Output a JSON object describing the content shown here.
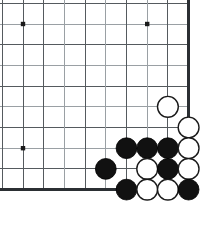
{
  "diagram": {
    "type": "go-board-corner",
    "board": {
      "columns": 10,
      "rows": 10,
      "cell_size": 20.7,
      "origin_x": 2.3,
      "origin_y": 3.3,
      "line_color": "#555a5e",
      "faint_line_color": "#9aa0a4",
      "edge_color": "#2b2f33",
      "background_color": "#ffffff",
      "right_edge_index": 9,
      "bottom_edge_index": 9,
      "top_open": true,
      "left_open": true
    },
    "star_points": [
      {
        "col": 1,
        "row": 1
      },
      {
        "col": 7,
        "row": 1
      },
      {
        "col": 1,
        "row": 7
      }
    ],
    "stone_radius": 10.4,
    "stones": [
      {
        "color": "white",
        "col": 8,
        "row": 5
      },
      {
        "color": "white",
        "col": 9,
        "row": 6
      },
      {
        "color": "black",
        "col": 6,
        "row": 7
      },
      {
        "color": "black",
        "col": 7,
        "row": 7
      },
      {
        "color": "black",
        "col": 8,
        "row": 7
      },
      {
        "color": "white",
        "col": 9,
        "row": 7
      },
      {
        "color": "black",
        "col": 5,
        "row": 8
      },
      {
        "color": "white",
        "col": 7,
        "row": 8
      },
      {
        "color": "black",
        "col": 8,
        "row": 8
      },
      {
        "color": "white",
        "col": 9,
        "row": 8
      },
      {
        "color": "black",
        "col": 6,
        "row": 9
      },
      {
        "color": "white",
        "col": 7,
        "row": 9
      },
      {
        "color": "white",
        "col": 8,
        "row": 9
      },
      {
        "color": "black",
        "col": 9,
        "row": 9
      }
    ],
    "stone_counts": {
      "black": 7,
      "white": 7,
      "total": 14
    },
    "colors": {
      "black_stone": "#111111",
      "white_stone": "#ffffff",
      "white_stone_outline": "#1a1a1a",
      "star_point": "#1a1a1a"
    }
  }
}
